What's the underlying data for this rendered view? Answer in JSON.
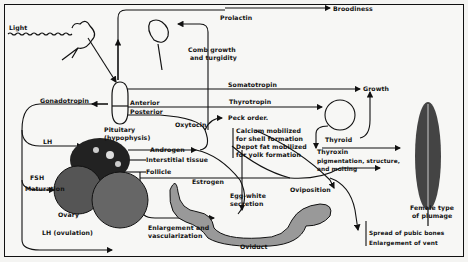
{
  "diagram": {
    "inputs": {
      "light": "Light"
    },
    "glands": {
      "pituitary_line1": "Pituitary",
      "pituitary_line2": "(hypophysis)",
      "anterior": "Anterior",
      "posterior": "Posterior",
      "thyroid": "Thyroid",
      "ovary": "Ovary",
      "oviduct": "Oviduct"
    },
    "hormones": {
      "prolactin": "Prolactin",
      "somatotropin": "Somatotropin",
      "thyrotropin": "Thyrotropin",
      "gonadotropin": "Gonadotropin",
      "oxytocin": "Oxytocin",
      "androgen": "Androgen",
      "lh": "LH",
      "fsh": "FSH",
      "lh_ovulation": "LH (ovulation)",
      "estrogen": "Estrogen",
      "thyroxin": "Thyroxin"
    },
    "tissues": {
      "interstitial": "Interstitial tissue",
      "follicle": "Follicle",
      "maturation": "Maturation"
    },
    "effects": {
      "broodiness": "Broodiness",
      "comb_line1": "Comb growth",
      "comb_line2": "and turgidity",
      "growth": "Growth",
      "peck_order": "Peck order.",
      "calcium_line1": "Calcium mobilized",
      "calcium_line2": "for shell formation",
      "depot_line1": "Depot fat mobilized",
      "depot_line2": "for yolk formation",
      "plumage_line1": "pigmentation, structure,",
      "plumage_line2": "and molting",
      "egg_white_line1": "Egg-white",
      "egg_white_line2": "secretion",
      "oviposition": "Oviposition",
      "enlargement_line1": "Enlargement and",
      "enlargement_line2": "vascularization",
      "female_plumage_line1": "Female type",
      "female_plumage_line2": "of plumage",
      "pubic_bones": "Spread of pubic bones",
      "vent": "Enlargement of vent"
    },
    "colors": {
      "ink": "#111111",
      "paper": "#f7f7f5"
    }
  }
}
